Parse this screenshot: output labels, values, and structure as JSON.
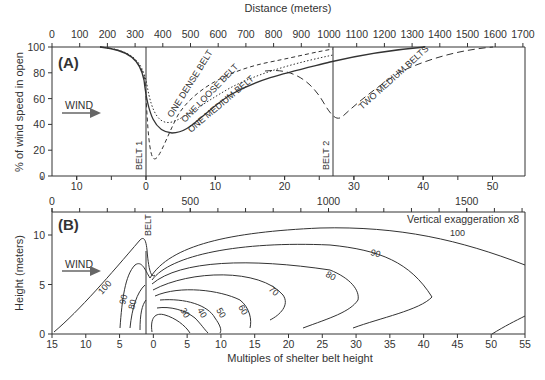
{
  "chart_data": [
    {
      "type": "line",
      "panel_label": "(A)",
      "title": "",
      "top_axis_label": "Distance (meters)",
      "top_ticks": [
        0,
        100,
        200,
        300,
        400,
        500,
        600,
        700,
        800,
        900,
        1000,
        1100,
        1200,
        1300,
        1400,
        1500,
        1600,
        1700
      ],
      "xlabel": "Multiples of shelter belt height",
      "bottom_ticks": [
        10,
        0,
        10,
        20,
        30,
        40,
        50
      ],
      "ylabel": "% of wind speed in open",
      "yticks": [
        0,
        20,
        40,
        60,
        80,
        100
      ],
      "ylim": [
        0,
        100
      ],
      "annotations": [
        "WIND",
        "BELT 1",
        "BELT 2"
      ],
      "series": [
        {
          "name": "ONE DENSE BELT",
          "style": "dashed",
          "x_multiples": [
            -15,
            -6,
            -3,
            -1,
            0,
            1,
            2,
            4,
            8,
            12,
            18,
            24,
            30
          ],
          "values": [
            100,
            99,
            95,
            85,
            60,
            15,
            25,
            50,
            68,
            78,
            85,
            92,
            99
          ]
        },
        {
          "name": "ONE LOOSE BELT",
          "style": "dotted",
          "x_multiples": [
            -15,
            -6,
            -3,
            -1,
            0,
            2,
            4,
            8,
            12,
            18,
            24,
            28
          ],
          "values": [
            100,
            99,
            95,
            86,
            70,
            45,
            40,
            55,
            67,
            78,
            87,
            98
          ]
        },
        {
          "name": "ONE MEDIUM BELT",
          "style": "solid",
          "x_multiples": [
            -15,
            -6,
            -3,
            -1,
            0,
            2,
            4,
            8,
            12,
            18,
            24,
            30
          ],
          "values": [
            100,
            99,
            94,
            84,
            65,
            38,
            33,
            48,
            62,
            74,
            84,
            99
          ]
        },
        {
          "name": "TWO MEDIUM BELTS",
          "style": "long-dashed",
          "x_multiples": [
            -15,
            -6,
            -3,
            -1,
            0,
            2,
            4,
            8,
            12,
            18,
            22,
            26,
            28,
            32,
            36,
            40,
            45
          ],
          "values": [
            100,
            99,
            94,
            84,
            65,
            38,
            33,
            48,
            62,
            74,
            80,
            62,
            48,
            58,
            75,
            90,
            100
          ]
        }
      ]
    },
    {
      "type": "contour",
      "panel_label": "(B)",
      "top_ticks": [
        0,
        500,
        1000,
        1500
      ],
      "xlabel": "Multiples of shelter belt height",
      "xticks": [
        15,
        10,
        5,
        0,
        5,
        10,
        15,
        20,
        25,
        30,
        35,
        40,
        45,
        50,
        55
      ],
      "ylabel": "Height (meters)",
      "yticks": [
        0,
        5,
        10
      ],
      "annotations": [
        "WIND",
        "BELT",
        "Vertical exaggeration x8"
      ],
      "contour_levels": [
        100,
        90,
        80,
        70,
        60,
        50,
        40,
        30
      ]
    }
  ],
  "panelA": {
    "label": "(A)",
    "top_axis_title": "Distance (meters)",
    "top_ticks": [
      "0",
      "100",
      "200",
      "300",
      "400",
      "500",
      "600",
      "700",
      "800",
      "900",
      "1000",
      "1100",
      "1200",
      "1300",
      "1400",
      "1500",
      "1600",
      "1700"
    ],
    "y_title": "% of wind speed in open",
    "y_ticks": [
      "0",
      "20",
      "40",
      "60",
      "80",
      "100"
    ],
    "bottom_ticks": [
      "10",
      "0",
      "10",
      "20",
      "30",
      "40",
      "50"
    ],
    "wind": "WIND",
    "belt1": "BELT 1",
    "belt2": "BELT 2",
    "dense": "ONE DENSE BELT",
    "loose": "ONE LOOSE BELT",
    "medium": "ONE MEDIUM BELT",
    "two": "TWO MEDIUM BELTS"
  },
  "panelB": {
    "label": "(B)",
    "top_ticks": [
      "0",
      "500",
      "1000",
      "1500"
    ],
    "y_title": "Height (meters)",
    "y_ticks": [
      "0",
      "5",
      "10"
    ],
    "x_ticks": [
      "15",
      "10",
      "5",
      "0",
      "5",
      "10",
      "15",
      "20",
      "25",
      "30",
      "35",
      "40",
      "45",
      "50",
      "55"
    ],
    "x_title": "Multiples of shelter belt height",
    "wind": "WIND",
    "belt": "BELT",
    "exaggeration": "Vertical exaggeration x8",
    "contour_labels": {
      "c100a": "100",
      "c100b": "100",
      "c90a": "90",
      "c90b": "90",
      "c80a": "80",
      "c80b": "80",
      "c70": "70",
      "c60": "60",
      "c50": "50",
      "c40": "40",
      "c30": "30"
    }
  },
  "colors": {
    "ink": "#333333",
    "arrow": "#666666"
  }
}
